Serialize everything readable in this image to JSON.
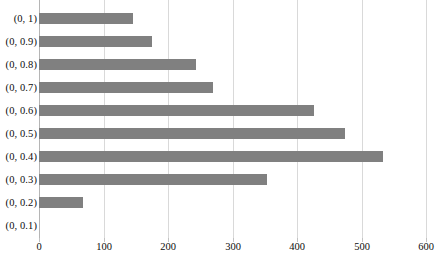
{
  "chart_data": {
    "type": "bar",
    "orientation": "horizontal",
    "title": "",
    "xlabel": "",
    "ylabel": "",
    "grid": true,
    "legend": false,
    "xlim": [
      0,
      600
    ],
    "xticks": [
      0,
      100,
      200,
      300,
      400,
      500,
      600
    ],
    "xtick_labels": [
      "0",
      "100",
      "200",
      "300",
      "400",
      "500",
      "600"
    ],
    "categories": [
      "(0, 1)",
      "(0, 0.9)",
      "(0, 0.8)",
      "(0, 0.7)",
      "(0, 0.6)",
      "(0, 0.5)",
      "(0, 0.4)",
      "(0, 0.3)",
      "(0, 0.2)",
      "(0, 0.1)"
    ],
    "values": [
      145,
      175,
      243,
      270,
      426,
      474,
      533,
      354,
      68,
      0
    ],
    "bar_color": "#808080",
    "gridline_color": "#d9d9d9",
    "axis_color": "#b5b5b5",
    "background_color": "#ffffff",
    "text_color": "#0d0d0d"
  }
}
